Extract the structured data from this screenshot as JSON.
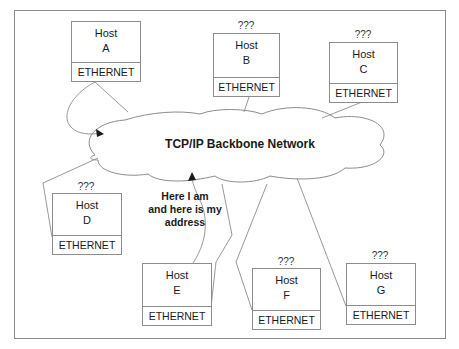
{
  "diagram": {
    "network": {
      "label": "TCP/IP Backbone Network"
    },
    "callout": {
      "line1": "Here I am",
      "line2": "and here is my",
      "line3": "address"
    },
    "hosts": [
      {
        "id": "A",
        "name": "Host",
        "letter": "A",
        "interface": "ETHERNET",
        "unknown_marker": ""
      },
      {
        "id": "B",
        "name": "Host",
        "letter": "B",
        "interface": "ETHERNET",
        "unknown_marker": "???"
      },
      {
        "id": "C",
        "name": "Host",
        "letter": "C",
        "interface": "ETHERNET",
        "unknown_marker": "???"
      },
      {
        "id": "D",
        "name": "Host",
        "letter": "D",
        "interface": "ETHERNET",
        "unknown_marker": "???"
      },
      {
        "id": "E",
        "name": "Host",
        "letter": "E",
        "interface": "ETHERNET",
        "unknown_marker": ""
      },
      {
        "id": "F",
        "name": "Host",
        "letter": "F",
        "interface": "ETHERNET",
        "unknown_marker": "???"
      },
      {
        "id": "G",
        "name": "Host",
        "letter": "G",
        "interface": "ETHERNET",
        "unknown_marker": "???"
      }
    ],
    "colors": {
      "line": "#8c8c8c",
      "text": "#1a1a1a",
      "background": "#ffffff"
    }
  }
}
